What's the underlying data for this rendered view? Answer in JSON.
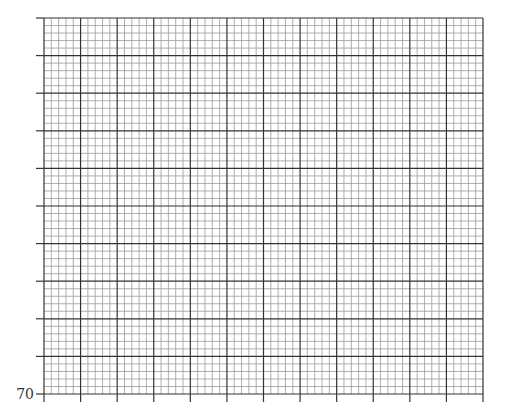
{
  "chart_data": {
    "type": "scatter",
    "title": "",
    "xlabel": "",
    "ylabel": "",
    "grid": true,
    "plot_area_px": {
      "left": 44,
      "top": 18,
      "right": 483,
      "bottom": 394
    },
    "major_columns": 12,
    "major_rows": 10,
    "minor_per_major": 5,
    "y_tick_labels": [
      {
        "index": 0,
        "label": "70"
      }
    ],
    "series": [],
    "colors": {
      "major_line": "#333333",
      "minor_line": "#9a9a9a",
      "background": "#ffffff"
    }
  },
  "axis": {
    "y_bottom_label": "70"
  }
}
